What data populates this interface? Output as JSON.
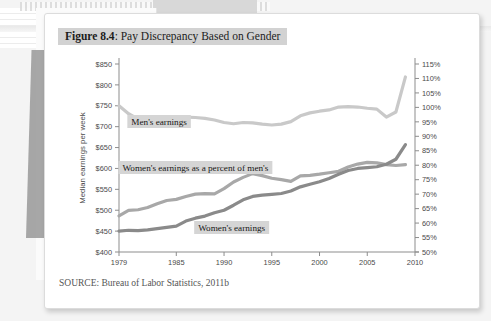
{
  "figure": {
    "number_label": "Figure 8.4",
    "separator": ": ",
    "title": "Pay Discrepancy Based on Gender",
    "source": "SOURCE: Bureau of Labor Statistics, 2011b"
  },
  "chart_data": {
    "type": "line",
    "title": "Pay Discrepancy Based on Gender",
    "xlabel": "",
    "ylabel": "Median earnings per week",
    "y2label": "",
    "xlim": [
      1979,
      2010
    ],
    "ylim": [
      400,
      850
    ],
    "y2lim": [
      50,
      115
    ],
    "grid": false,
    "legend_position": "inline-annotations",
    "x_ticks": [
      "1979",
      "1985",
      "1990",
      "1995",
      "2000",
      "2005",
      "2010"
    ],
    "x_tick_values": [
      1979,
      1985,
      1990,
      1995,
      2000,
      2005,
      2010
    ],
    "y_ticks": [
      "$400",
      "$450",
      "$500",
      "$550",
      "$600",
      "$650",
      "$700",
      "$750",
      "$800",
      "$850"
    ],
    "y_tick_values": [
      400,
      450,
      500,
      550,
      600,
      650,
      700,
      750,
      800,
      850
    ],
    "y2_ticks": [
      "50%",
      "55%",
      "60%",
      "65%",
      "70%",
      "75%",
      "80%",
      "85%",
      "90%",
      "95%",
      "100%",
      "105%",
      "110%",
      "115%"
    ],
    "y2_tick_values": [
      50,
      55,
      60,
      65,
      70,
      75,
      80,
      85,
      90,
      95,
      100,
      105,
      110,
      115
    ],
    "x": [
      1979,
      1980,
      1981,
      1982,
      1983,
      1984,
      1985,
      1986,
      1987,
      1988,
      1989,
      1990,
      1991,
      1992,
      1993,
      1994,
      1995,
      1996,
      1997,
      1998,
      1999,
      2000,
      2001,
      2002,
      2003,
      2004,
      2005,
      2006,
      2007,
      2008,
      2009
    ],
    "series": [
      {
        "name": "Men's earnings",
        "axis": "left",
        "color": "#c9c9c9",
        "label_text": "Men's earnings",
        "values": [
          750,
          731,
          718,
          714,
          713,
          716,
          718,
          723,
          722,
          720,
          716,
          710,
          707,
          710,
          709,
          706,
          704,
          706,
          712,
          726,
          733,
          737,
          740,
          747,
          748,
          747,
          744,
          742,
          723,
          735,
          819
        ]
      },
      {
        "name": "Women's earnings as a percent of men's",
        "axis": "right",
        "color": "#a8a8a8",
        "label_text": "Women's earnings as a percent of men's",
        "values": [
          62.5,
          64.4,
          64.6,
          65.4,
          66.7,
          67.8,
          68.2,
          69.2,
          70.0,
          70.2,
          70.1,
          71.9,
          74.2,
          75.8,
          77.1,
          76.4,
          75.5,
          75.0,
          74.4,
          76.3,
          76.5,
          76.9,
          77.4,
          77.9,
          79.4,
          80.4,
          81.0,
          80.8,
          80.2,
          79.9,
          80.2
        ]
      },
      {
        "name": "Women's earnings",
        "axis": "left",
        "color": "#8a8a8a",
        "label_text": "Women's earnings",
        "values": [
          450,
          452,
          451,
          453,
          456,
          459,
          462,
          474,
          481,
          486,
          494,
          500,
          512,
          525,
          533,
          536,
          538,
          540,
          546,
          556,
          562,
          568,
          576,
          586,
          595,
          600,
          602,
          604,
          610,
          622,
          657
        ]
      }
    ],
    "annotations": [
      {
        "text": "Men's earnings",
        "x": 1983.2,
        "y_px": 110
      },
      {
        "text": "Women's earnings as a percent of men's",
        "x": 1987.0,
        "y_px": 156
      },
      {
        "text": "Women's earnings",
        "x": 1990.8,
        "y_px": 216
      }
    ]
  }
}
